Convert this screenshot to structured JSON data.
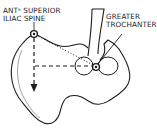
{
  "diagram": {
    "type": "anatomical line drawing",
    "labels": {
      "asis_line1": "ANTᵃ SUPERIOR",
      "asis_line2": "ILIAC SPINE",
      "gt_line1": "GREATER",
      "gt_line2": "TROCHANTER"
    },
    "landmarks": [
      {
        "name": "Anterior superior iliac spine",
        "x": 34,
        "y": 34
      },
      {
        "name": "Greater trochanter",
        "x": 96,
        "y": 67
      }
    ],
    "lines": [
      {
        "style": "dotted",
        "from": "Anterior superior iliac spine",
        "to": "Greater trochanter"
      },
      {
        "style": "dashed",
        "direction": "vertical down from ASIS",
        "arrow": true
      },
      {
        "style": "dashed",
        "direction": "horizontal from greater trochanter to vertical line"
      }
    ],
    "colors": {
      "ink": "#1c1c1c",
      "background": "#ffffff"
    }
  }
}
